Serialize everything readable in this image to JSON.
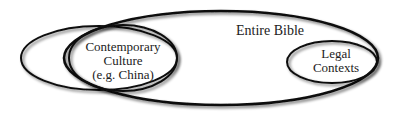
{
  "diagram": {
    "type": "venn",
    "sets": [
      {
        "id": "entire-bible",
        "label": "Entire Bible"
      },
      {
        "id": "contemporary-culture",
        "label_lines": [
          "Contemporary",
          "Culture",
          "(e.g. China)"
        ]
      },
      {
        "id": "legal-contexts",
        "label_lines": [
          "Legal",
          "Contexts"
        ]
      }
    ],
    "stroke_color": "#111111",
    "background": "#ffffff"
  }
}
